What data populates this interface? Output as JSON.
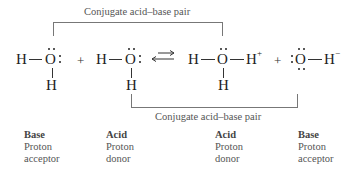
{
  "diagram": {
    "top_bracket": {
      "label": "Conjugate acid–base pair"
    },
    "bottom_bracket": {
      "label": "Conjugate acid–base pair"
    },
    "equation": {
      "species": [
        {
          "id": "water-base",
          "atoms": [
            "H",
            "O",
            "H"
          ],
          "charge": ""
        },
        {
          "id": "water-acid",
          "atoms": [
            "H",
            "O",
            "H"
          ],
          "charge": ""
        },
        {
          "id": "hydronium",
          "atoms": [
            "H",
            "O",
            "H",
            "H"
          ],
          "charge": "+"
        },
        {
          "id": "hydroxide",
          "atoms": [
            "O",
            "H"
          ],
          "charge": "−"
        }
      ],
      "plus_sign": "+",
      "arrow": "equilibrium-arrows-icon"
    },
    "labels": [
      {
        "role": "Base",
        "line1": "Proton",
        "line2": "acceptor"
      },
      {
        "role": "Acid",
        "line1": "Proton",
        "line2": "donor"
      },
      {
        "role": "Acid",
        "line1": "Proton",
        "line2": "donor"
      },
      {
        "role": "Base",
        "line1": "Proton",
        "line2": "acceptor"
      }
    ],
    "symbols": {
      "H": "H",
      "O": "O",
      "plus_charge": "+",
      "minus_charge": "−"
    }
  },
  "colors": {
    "bracket_line": "#777777",
    "bracket_text": "#555555",
    "text": "#222222",
    "background": "#ffffff"
  }
}
